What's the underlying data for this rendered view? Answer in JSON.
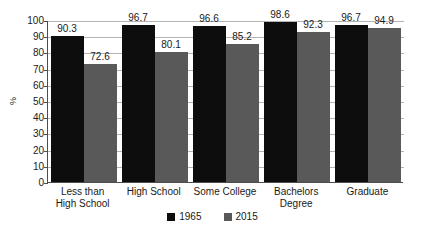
{
  "chart_data": {
    "type": "bar",
    "title": "",
    "subtitle": "",
    "xlabel": "",
    "ylabel": "%",
    "ylim": [
      0,
      100
    ],
    "ytick_step": 10,
    "yticks": [
      "100",
      "90",
      "80",
      "70",
      "60",
      "50",
      "40",
      "30",
      "20",
      "10",
      "0"
    ],
    "grid": true,
    "legend_position": "bottom-center",
    "categories": [
      "Less than High School",
      "High School",
      "Some College",
      "Bachelors Degree",
      "Graduate"
    ],
    "category_lines": [
      [
        "Less than",
        "High School"
      ],
      [
        "High School"
      ],
      [
        "Some College"
      ],
      [
        "Bachelors Degree"
      ],
      [
        "Graduate"
      ]
    ],
    "series": [
      {
        "name": "1965",
        "color": "#0d0d0d",
        "values": [
          90.3,
          96.7,
          96.6,
          98.6,
          96.7
        ],
        "labels": [
          "90.3",
          "96.7",
          "96.6",
          "98.6",
          "96.7"
        ]
      },
      {
        "name": "2015",
        "color": "#595959",
        "values": [
          72.6,
          80.1,
          85.2,
          92.3,
          94.9
        ],
        "labels": [
          "72.6",
          "80.1",
          "85.2",
          "92.3",
          "94.9"
        ]
      }
    ]
  },
  "colors": {
    "series_1965": "#0d0d0d",
    "series_2015": "#595959",
    "gridline": "#b3b3b3",
    "axis": "#4d4d4d",
    "text": "#1a1a1a",
    "background": "#ffffff"
  }
}
